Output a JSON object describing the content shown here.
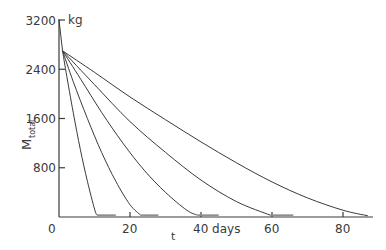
{
  "chart_data": {
    "type": "line",
    "title": "",
    "xlabel": "t",
    "xunit": "days",
    "ylabel": "M_total",
    "yunit": "kg",
    "xlim": [
      0,
      90
    ],
    "ylim": [
      0,
      3200
    ],
    "grid": false,
    "legend": "none",
    "x_ticks": [
      0,
      20,
      40,
      60,
      80
    ],
    "x_tick_labels": [
      "0",
      "20",
      "40 days",
      "60",
      "80"
    ],
    "y_ticks": [
      800,
      1600,
      2400,
      3200
    ],
    "y_tick_labels": [
      "800",
      "1600",
      "2400",
      "3200"
    ],
    "initial_drop": {
      "x": [
        0,
        1
      ],
      "y": [
        3200,
        2700
      ]
    },
    "series": [
      {
        "name": "curve-1",
        "x": [
          1,
          2,
          4,
          6,
          8,
          10,
          10.7,
          16
        ],
        "y": [
          2700,
          2350,
          1700,
          1100,
          580,
          130,
          30,
          30
        ]
      },
      {
        "name": "curve-2",
        "x": [
          1,
          4,
          8,
          12,
          16,
          20,
          23,
          28
        ],
        "y": [
          2700,
          2200,
          1600,
          1050,
          580,
          200,
          30,
          30
        ]
      },
      {
        "name": "curve-3",
        "x": [
          1,
          6,
          12,
          18,
          24,
          30,
          36,
          39,
          45
        ],
        "y": [
          2700,
          2250,
          1700,
          1200,
          760,
          400,
          110,
          30,
          30
        ]
      },
      {
        "name": "curve-4",
        "x": [
          1,
          10,
          20,
          30,
          40,
          50,
          59.5,
          66
        ],
        "y": [
          2700,
          2150,
          1550,
          1050,
          600,
          250,
          30,
          30
        ]
      },
      {
        "name": "curve-5",
        "x": [
          1,
          10,
          20,
          30,
          40,
          50,
          60,
          70,
          80,
          87
        ],
        "y": [
          2700,
          2350,
          1950,
          1580,
          1220,
          880,
          570,
          310,
          110,
          20
        ]
      }
    ]
  },
  "labels": {
    "y_unit": "kg",
    "y_axis_main": "M",
    "y_axis_sub": "total",
    "x_axis": "t",
    "origin": "0"
  }
}
